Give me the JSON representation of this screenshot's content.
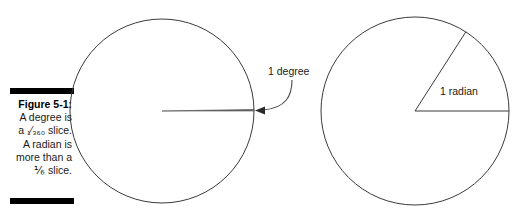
{
  "figure": {
    "caption_label": "Figure 5-1:",
    "caption_lines": [
      "A degree is",
      "a ₁₃₆₀ slice.",
      "A radian is",
      "more than a",
      "⅙ slice."
    ],
    "caption_line_1": "A degree is",
    "caption_line_2_prefix": "a ",
    "caption_line_2_fraction": "₁⁄₃₆₀",
    "caption_line_2_suffix": " slice.",
    "caption_line_3": "A radian is",
    "caption_line_4": "more than a",
    "caption_line_5_fraction": "⅙",
    "caption_line_5_suffix": " slice.",
    "rule_color": "#000000",
    "line_color": "#333333",
    "text_color": "#1a1a1a"
  },
  "diagrams": {
    "left": {
      "name": "degree-circle",
      "label": "1 degree",
      "center_x": 162,
      "center_y": 111,
      "radius": 92,
      "wedge_angle_degrees": 1,
      "wedge_start_degrees": 0
    },
    "right": {
      "name": "radian-circle",
      "label": "1 radian",
      "center_x": 415,
      "center_y": 111,
      "radius": 94,
      "wedge_angle_degrees": 57.3,
      "wedge_start_degrees": 0
    }
  },
  "chart_data": {
    "type": "diagram",
    "title": "Figure 5-1",
    "series": [
      {
        "name": "1 degree",
        "angle_degrees": 1,
        "fraction_of_circle": "1/360",
        "circle": "left"
      },
      {
        "name": "1 radian",
        "angle_degrees": 57.3,
        "fraction_of_circle": "greater than 1/6",
        "circle": "right"
      }
    ],
    "annotations": [
      "1 degree",
      "1 radian"
    ]
  }
}
